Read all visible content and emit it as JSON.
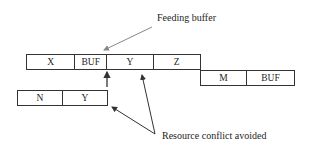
{
  "diagram": {
    "labels": {
      "feeding_buffer": "Feeding buffer",
      "resource_conflict": "Resource conflict avoided"
    },
    "rows": {
      "top": {
        "cells": [
          {
            "label": "X",
            "width": 49
          },
          {
            "label": "BUF",
            "width": 32
          },
          {
            "label": "Y",
            "width": 47
          },
          {
            "label": "Z",
            "width": 46
          }
        ]
      },
      "right": {
        "cells": [
          {
            "label": "M",
            "width": 47
          },
          {
            "label": "BUF",
            "width": 47
          }
        ]
      },
      "bottom_left": {
        "cells": [
          {
            "label": "N",
            "width": 46
          },
          {
            "label": "Y",
            "width": 44
          }
        ]
      }
    },
    "colors": {
      "box_border": "#333333",
      "text": "#1e1e1e",
      "feeding_arrow": "#888888",
      "conflict_arrow": "#333333"
    }
  }
}
